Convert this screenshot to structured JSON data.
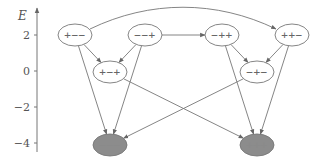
{
  "diagram": {
    "axis": {
      "label": "E",
      "ticks": [
        {
          "value": "2",
          "y": 35
        },
        {
          "value": "0",
          "y": 71
        },
        {
          "value": "−2",
          "y": 107
        },
        {
          "value": "−4",
          "y": 143
        }
      ]
    },
    "colors": {
      "stroke": "#777777",
      "filled_node": "#8c8c8c",
      "background": "#ffffff"
    },
    "nodes": [
      {
        "id": "pmm",
        "label": "+−−",
        "x": 75,
        "y": 35,
        "filled": false
      },
      {
        "id": "mmp",
        "label": "−−+",
        "x": 145,
        "y": 35,
        "filled": false
      },
      {
        "id": "pmp",
        "label": "+−+",
        "x": 110,
        "y": 72,
        "filled": false
      },
      {
        "id": "mpp",
        "label": "−++",
        "x": 222,
        "y": 35,
        "filled": false
      },
      {
        "id": "ppm",
        "label": "++−",
        "x": 292,
        "y": 35,
        "filled": false
      },
      {
        "id": "mpm",
        "label": "−+−",
        "x": 257,
        "y": 72,
        "filled": false
      },
      {
        "id": "mmm",
        "label": "−−−",
        "x": 110,
        "y": 145,
        "filled": true
      },
      {
        "id": "ppp",
        "label": "+++",
        "x": 257,
        "y": 145,
        "filled": true
      }
    ],
    "edges": [
      {
        "from": "pmm",
        "to": "pmp"
      },
      {
        "from": "mmp",
        "to": "pmp"
      },
      {
        "from": "mmp",
        "to": "mpp"
      },
      {
        "from": "pmm",
        "to": "ppm",
        "curved": true
      },
      {
        "from": "mpp",
        "to": "mpm"
      },
      {
        "from": "ppm",
        "to": "mpm"
      },
      {
        "from": "pmm",
        "to": "mmm"
      },
      {
        "from": "mmp",
        "to": "mmm"
      },
      {
        "from": "mpp",
        "to": "ppp"
      },
      {
        "from": "ppm",
        "to": "ppp"
      },
      {
        "from": "pmp",
        "to": "ppp"
      },
      {
        "from": "mpm",
        "to": "mmm"
      }
    ]
  }
}
